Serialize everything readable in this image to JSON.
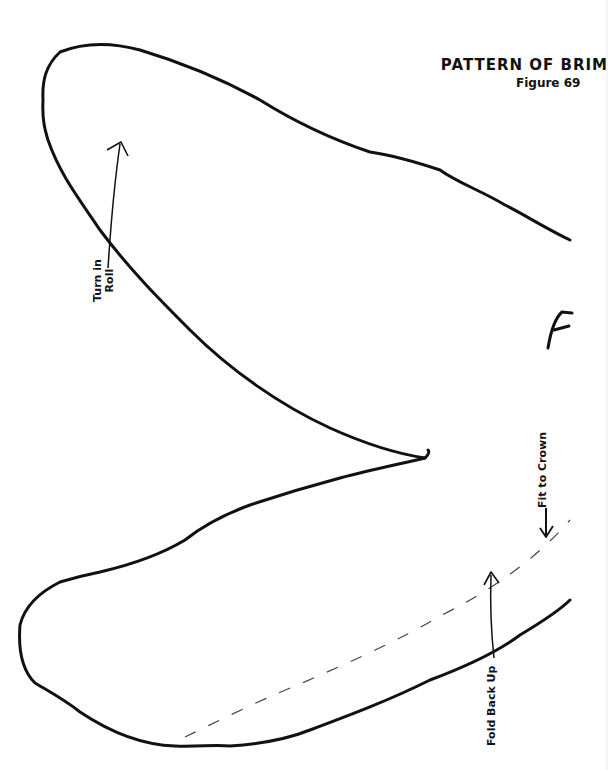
{
  "figure": {
    "title": "PATTERN OF BRIM",
    "subtitle": "Figure 69"
  },
  "labels": {
    "turn_in_roll_line1": "Turn in",
    "turn_in_roll_line2": "Roll",
    "fold_back_up": "Fold Back Up",
    "fit_to_crown": "Fit to Crown"
  },
  "annotations": {
    "pencil_mark": "F"
  },
  "colors": {
    "ink": "#111111",
    "paper": "#ffffff",
    "dashed_line": "#444444"
  }
}
